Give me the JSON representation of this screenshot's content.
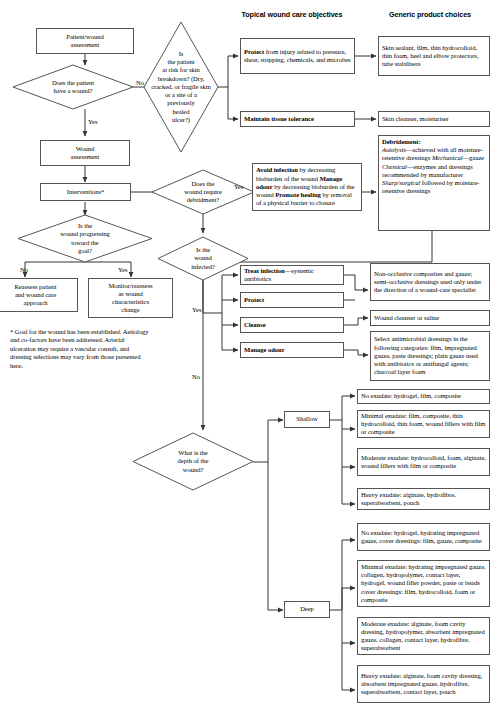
{
  "headers": {
    "topical": "Topical wound care\nobjectives",
    "generic": "Generic product\nchoices"
  },
  "nodes": {
    "patient_wound_assessment": "Patient/wound\nassessment",
    "have_wound": "Does the patient\nhave a wound?",
    "at_risk": "Is\nthe patient\nat risk for skin\nbreakdown? (Dry,\ncracked, or fragile skin\nor a site of a\npreviously\nhealed\nulcer?)",
    "wound_assessment": "Wound\nassessment",
    "interventions": "Interventions*",
    "progressing": "Is the\nwound progressing\ntoward the\ngoal?",
    "reassess": "Reassess patient\nand wound care\napproach",
    "monitor": "Monitor/reassess\nas wound\ncharacteristics\nchange",
    "require_debridement": "Does the\nwound require\ndebridment?",
    "infected": "Is the\nwound\ninfected?",
    "depth": "What is the\ndepth of the\nwound?",
    "shallow": "Shallow",
    "deep": "Deep"
  },
  "objectives": {
    "protect_injury": {
      "bold": "Protect",
      "rest": " from injury related to pressure, shear, stripping, chemicals, and microbes"
    },
    "maintain_tissue": "Maintain tissue tolerance",
    "debridement_obj": [
      {
        "bold": "Avoid infection",
        "rest": " by decreasing bioburden of the wound"
      },
      {
        "bold": "Manage odour",
        "rest": " by decreasing bioburden of the wound"
      },
      {
        "bold": "Promote healing",
        "rest": " by removal of a physical barrier to closure"
      }
    ],
    "treat_infection": {
      "bold": "Treat infection",
      "rest": "—systemic antibiotics"
    },
    "protect": "Protect",
    "cleanse": "Cleanse",
    "manage_odour": "Manage odour"
  },
  "products": {
    "skin_sealant": "Skin sealant, film, thin hydrocolloid, thin foam, heel and elbow protectors, tube stabilisers",
    "skin_cleanser": "Skin cleanser, moisturiser",
    "debridement": {
      "title": "Debridement:",
      "lines": [
        {
          "i": "Autolysis",
          "rest": "—achieved with all moisture-retentive dressings"
        },
        {
          "i": "Mechanical",
          "rest": "—gauze"
        },
        {
          "i": "Chemical",
          "rest": "—enzymes and dressings recommended by manufacturer"
        },
        {
          "i": "Sharp/surgical",
          "rest": " followed by moisture-retentive dressings"
        }
      ]
    },
    "non_occlusive": "Non-occlusive composites and gauze; semi-occlusive dressings used only under the direction of a wound-care specialist",
    "wound_cleanser": "Wound cleanser or saline",
    "antimicrobial": "Select antimicrobial dressings in the following categories: film, impregnated gauze, paste dressings; plain gauze used with antibiotics or antifungal agents; charcoal layer foam",
    "shallow": [
      "No exudate: hydrogel, film, composite",
      "Minimal exudate: film, composite, thin hydrocolloid, thin foam, wound fillers with film or composite",
      "Moderate exudate: hydrocolloid, foam, alginate, wound fillers with film or composite",
      "Heavy exudate: alginate, hydrofibre, superabsorbent, pouch"
    ],
    "deep": [
      "No exudate: hydrogel, hydrating impregnated gauze, cover dressings: film, gauze, composite",
      "Minimal exudate: hydrating impregnated gauze, collagen, hydropolymer, contact layer, hydrogel, wound filler powder, paste or beads cover dressings: film, hydrocolloid, foam or composite",
      "Moderate exudate: alginate, foam cavity dressing, hydropolymer, absorbent impregnated gauze, collagen, contact layer, hydrofibre, superabsorbent",
      "Heavy exudate: alginate, foam cavity dressing, absorbent impregnated gauze, hydrofibre, superabsorbent, contact layer, pouch"
    ]
  },
  "labels": {
    "no1": "No",
    "yes1": "Yes",
    "yes_debride": "Yes",
    "no_debride": "No",
    "no_progress": "No",
    "yes_progress": "Yes",
    "yes_infected": "Yes",
    "no_infected": "No"
  },
  "footnote": "* Goal for the wound has been established. Aetiology and co-factors have been addressed. Arterial ulceration may require a vascular consult, and dressing selections may vary from those presented here."
}
